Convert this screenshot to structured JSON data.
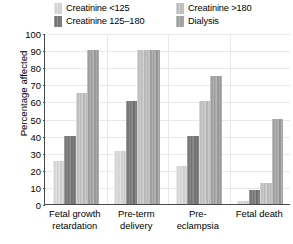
{
  "chart_data": {
    "type": "bar",
    "title": "",
    "xlabel": "",
    "ylabel": "Percentage affected",
    "ylim": [
      0,
      100
    ],
    "ytick_step": 10,
    "yticks": [
      0,
      10,
      20,
      30,
      40,
      50,
      60,
      70,
      80,
      90,
      100
    ],
    "grid": true,
    "legend_position": "top",
    "categories": [
      "Fetal growth retardation",
      "Pre-term delivery",
      "Pre-eclampsia",
      "Fetal death"
    ],
    "category_lines": [
      [
        "Fetal growth",
        "retardation"
      ],
      [
        "Pre-term",
        "delivery"
      ],
      [
        "Pre-",
        "eclampsia"
      ],
      [
        "Fetal death",
        ""
      ]
    ],
    "series": [
      {
        "name": "Creatinine <125",
        "color": "#d8d8d8",
        "values": [
          25,
          31,
          22,
          2
        ]
      },
      {
        "name": "Creatinine 125–180",
        "color": "#787878",
        "values": [
          40,
          60,
          40,
          8
        ]
      },
      {
        "name": "Creatinine >180",
        "color": "#c2c2c2",
        "values": [
          65,
          90,
          60,
          12
        ]
      },
      {
        "name": "Dialysis",
        "color": "#a3a3a3",
        "values": [
          90,
          90,
          75,
          50
        ]
      }
    ]
  },
  "legend": {
    "items": [
      {
        "label": "Creatinine <125"
      },
      {
        "label": "Creatinine >180"
      },
      {
        "label": "Creatinine 125–180"
      },
      {
        "label": "Dialysis"
      }
    ]
  },
  "axes": {
    "y_title": "Percentage affected"
  }
}
